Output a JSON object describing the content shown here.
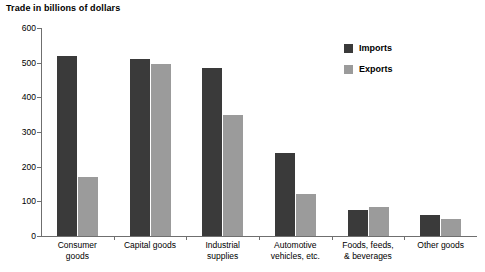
{
  "chart_data": {
    "type": "bar",
    "title": "Trade in billions of dollars",
    "xlabel": "",
    "ylabel": "",
    "ylim": [
      0,
      600
    ],
    "yticks": [
      0,
      100,
      200,
      300,
      400,
      500,
      600
    ],
    "grid": false,
    "legend_position": "top-right",
    "categories": [
      "Consumer\ngoods",
      "Capital goods",
      "Industrial\nsupplies",
      "Automotive\nvehicles, etc.",
      "Foods, feeds,\n& beverages",
      "Other goods"
    ],
    "series": [
      {
        "name": "Imports",
        "color": "#3a3a3a",
        "values": [
          520,
          510,
          485,
          240,
          75,
          62
        ]
      },
      {
        "name": "Exports",
        "color": "#9b9b9b",
        "values": [
          170,
          495,
          348,
          120,
          85,
          50
        ]
      }
    ]
  },
  "legend": {
    "items": [
      {
        "label": "Imports",
        "color": "#3a3a3a"
      },
      {
        "label": "Exports",
        "color": "#9b9b9b"
      }
    ]
  },
  "axis": {
    "y_labels": [
      "600",
      "500",
      "400",
      "300",
      "200",
      "100",
      "0"
    ]
  }
}
